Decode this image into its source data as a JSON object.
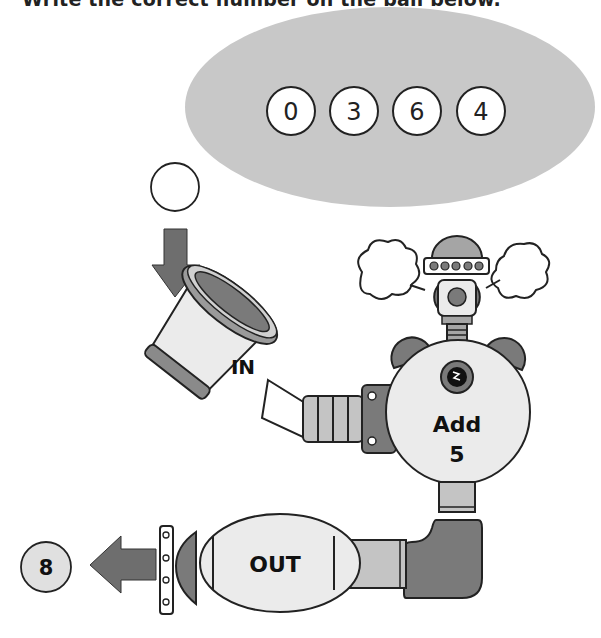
{
  "instruction": "Write the correct number on the ball below.",
  "options": {
    "items": [
      {
        "label": "0"
      },
      {
        "label": "3"
      },
      {
        "label": "6"
      },
      {
        "label": "4"
      }
    ]
  },
  "machine": {
    "input_label": "IN",
    "operation_label": "Add",
    "operation_value": "5",
    "output_label": "OUT"
  },
  "input_ball": {
    "value": ""
  },
  "output_ball": {
    "value": "8"
  },
  "colors": {
    "cloud": "#c8c8c8",
    "dark_part": "#7a7a7a",
    "mid_part": "#a5a5a5",
    "light_part": "#ebebeb",
    "arrow": "#6e6e6e",
    "outline": "#222222"
  }
}
